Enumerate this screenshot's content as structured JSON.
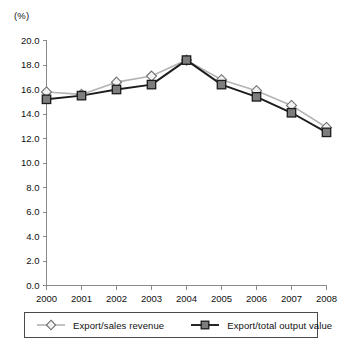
{
  "chart_data": {
    "type": "line",
    "title": "",
    "subtitle": "",
    "unit_label": "(%)",
    "xlabel": "",
    "ylabel": "",
    "categories": [
      "2000",
      "2001",
      "2002",
      "2003",
      "2004",
      "2005",
      "2006",
      "2007",
      "2008"
    ],
    "x": [
      2000,
      2001,
      2002,
      2003,
      2004,
      2005,
      2006,
      2007,
      2008
    ],
    "series": [
      {
        "name": "Export/sales revenue",
        "marker": "diamond",
        "color": "#b3b3b3",
        "marker_fill": "#f2f2f2",
        "marker_stroke": "#6e6e6e",
        "values": [
          15.8,
          15.6,
          16.6,
          17.1,
          18.4,
          16.8,
          15.9,
          14.7,
          12.9
        ]
      },
      {
        "name": "Export/total output value",
        "marker": "square",
        "color": "#1c1c1c",
        "marker_fill": "#7d7d7d",
        "marker_stroke": "#1c1c1c",
        "values": [
          15.2,
          15.5,
          16.0,
          16.4,
          18.4,
          16.4,
          15.4,
          14.1,
          12.5
        ]
      }
    ],
    "ylim": [
      0.0,
      20.0
    ],
    "ytick_step": 2.0,
    "ytick_labels": [
      "0.0",
      "2.0",
      "4.0",
      "6.0",
      "8.0",
      "10.0",
      "12.0",
      "14.0",
      "16.0",
      "18.0",
      "20.0"
    ],
    "xtick_labels": [
      "2000",
      "2001",
      "2002",
      "2003",
      "2004",
      "2005",
      "2006",
      "2007",
      "2008"
    ],
    "grid": false,
    "legend_position": "bottom"
  },
  "legend": {
    "entries": [
      {
        "label": "Export/sales revenue"
      },
      {
        "label": "Export/total output value"
      }
    ]
  }
}
